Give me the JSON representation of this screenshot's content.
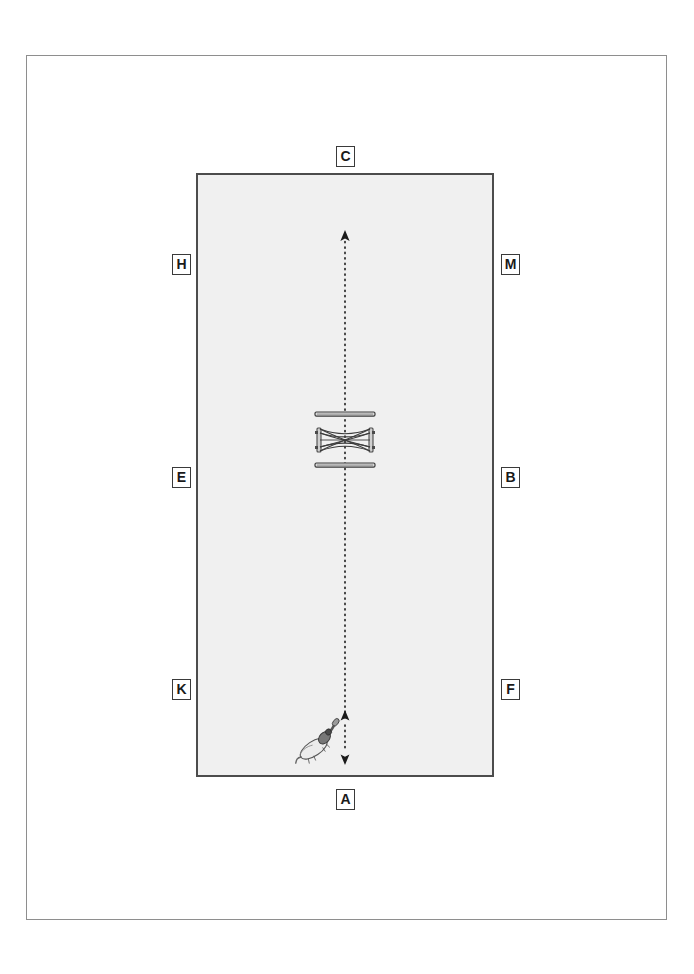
{
  "page": {
    "background_color": "#ffffff",
    "frame_color": "#8e8e8e"
  },
  "arena": {
    "name": "dressage-arena",
    "fill_color": "#f0f0f0",
    "border_color": "#4c4c4c",
    "orientation": "portrait",
    "shape": "rectangle"
  },
  "markers": [
    {
      "id": "C",
      "label": "C",
      "position": "top-center",
      "side": "short-end-top"
    },
    {
      "id": "H",
      "label": "H",
      "position": "upper-left",
      "side": "long-side-left"
    },
    {
      "id": "M",
      "label": "M",
      "position": "upper-right",
      "side": "long-side-right"
    },
    {
      "id": "E",
      "label": "E",
      "position": "middle-left",
      "side": "long-side-left"
    },
    {
      "id": "B",
      "label": "B",
      "position": "middle-right",
      "side": "long-side-right"
    },
    {
      "id": "K",
      "label": "K",
      "position": "lower-left",
      "side": "long-side-left"
    },
    {
      "id": "F",
      "label": "F",
      "position": "lower-right",
      "side": "long-side-right"
    },
    {
      "id": "A",
      "label": "A",
      "position": "bottom-center",
      "side": "short-end-bottom"
    }
  ],
  "centerline": {
    "name": "center-line",
    "style": "dash-dot",
    "color": "#1a1a1a",
    "direction": "A-to-C",
    "arrow_top": true,
    "arrow_bottom": true,
    "mid_arrow": true
  },
  "obstacle": {
    "name": "cross-rail-jump",
    "type": "crossrail-with-ground-poles",
    "ground_poles": 2,
    "rail_color": "#3c3c3c",
    "standard_color": "#4a4a4a"
  },
  "horse_rider": {
    "name": "horse-and-rider",
    "heading": "up-right",
    "body_color": "#e8e8e8",
    "outline_color": "#555555"
  }
}
